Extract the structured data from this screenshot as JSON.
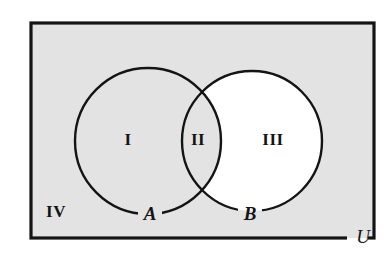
{
  "diagram": {
    "kind": "venn-diagram",
    "canvas": {
      "width": 389,
      "height": 256,
      "background": "#ffffff"
    },
    "colors": {
      "shaded_fill": "#e3e3e3",
      "unshaded_fill": "#ffffff",
      "stroke": "#141414",
      "label_color": "#141414"
    },
    "universe": {
      "label": "U",
      "label_x": 363,
      "label_y": 239,
      "rect": {
        "x": 31,
        "y": 23,
        "width": 343,
        "height": 215
      },
      "border_width": 3.2,
      "fill": "#e3e3e3"
    },
    "circles": [
      {
        "label": "A",
        "cx": 148,
        "cy": 141,
        "r": 73,
        "label_x": 150,
        "label_y": 216,
        "stroke_width": 2.4,
        "fill": "#e3e3e3"
      },
      {
        "label": "B",
        "cx": 252,
        "cy": 141,
        "r": 70,
        "label_x": 250,
        "label_y": 216,
        "stroke_width": 2.4,
        "fill": "#ffffff"
      }
    ],
    "regions": [
      {
        "id": "I",
        "label": "I",
        "meaning": "A only",
        "shaded": true,
        "x": 128,
        "y": 141
      },
      {
        "id": "II",
        "label": "II",
        "meaning": "A intersect B",
        "shaded": true,
        "x": 198,
        "y": 141
      },
      {
        "id": "III",
        "label": "III",
        "meaning": "B only",
        "shaded": false,
        "x": 273,
        "y": 141
      },
      {
        "id": "IV",
        "label": "IV",
        "meaning": "outside A and B",
        "shaded": true,
        "x": 56,
        "y": 213
      }
    ]
  }
}
